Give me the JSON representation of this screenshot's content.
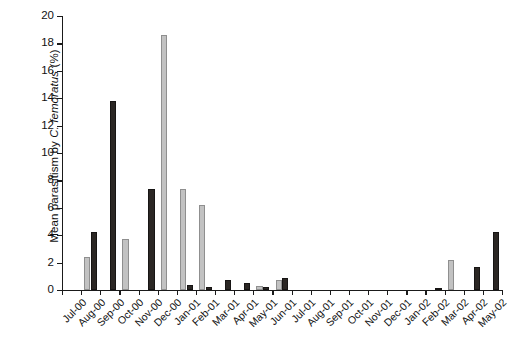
{
  "chart_data": {
    "type": "bar",
    "title": "",
    "xlabel": "",
    "ylabel_plain": "Mean parasitism by C. femoratus (%)",
    "ylabel_prefix": "Mean parasitism by ",
    "ylabel_italic": "C. femoratus",
    "ylabel_suffix": " (%)",
    "ylim": [
      0,
      20
    ],
    "ytick_values": [
      0,
      2,
      4,
      6,
      8,
      10,
      12,
      14,
      16,
      18,
      20
    ],
    "ytick_labels": [
      "0",
      "2",
      "4",
      "6",
      "8",
      "10",
      "12",
      "14",
      "16",
      "18",
      "20"
    ],
    "grid": false,
    "legend_position": "none",
    "categories": [
      "Jul-00",
      "Aug-00",
      "Sep-00",
      "Oct-00",
      "Nov-00",
      "Dec-00",
      "Jan-01",
      "Feb-01",
      "Mar-01",
      "Apr-01",
      "May-01",
      "Jun-01",
      "Jul-01",
      "Aug-01",
      "Sep-01",
      "Oct-01",
      "Nov-01",
      "Dec-01",
      "Jan-02",
      "Feb-02",
      "Mar-02",
      "Apr-02",
      "May-02"
    ],
    "series": [
      {
        "name": "light-series",
        "color": "#c2c2c2",
        "values": [
          0,
          2.4,
          0,
          3.7,
          0,
          18.6,
          7.4,
          6.2,
          0,
          0,
          0.3,
          0.7,
          0,
          0,
          0,
          0,
          0,
          0,
          0,
          0,
          2.2,
          0,
          0
        ]
      },
      {
        "name": "dark-series",
        "color": "#2b2724",
        "values": [
          0,
          4.2,
          13.8,
          0,
          7.4,
          0,
          0.35,
          0.25,
          0.7,
          0.5,
          0.25,
          0.9,
          0,
          0,
          0,
          0,
          0,
          0,
          0,
          0.15,
          0,
          1.7,
          4.2
        ]
      }
    ]
  }
}
